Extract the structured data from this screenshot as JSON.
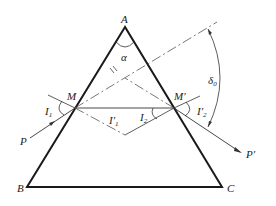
{
  "diagram": {
    "vertices": {
      "A": {
        "label": "A",
        "x": 125,
        "y": 27
      },
      "B": {
        "label": "B",
        "x": 27,
        "y": 187
      },
      "C": {
        "label": "C",
        "x": 222,
        "y": 187
      }
    },
    "points": {
      "M": {
        "label": "M",
        "x": 75,
        "y": 108
      },
      "M_prime": {
        "label": "M′",
        "x": 174,
        "y": 108
      }
    },
    "angles": {
      "apex": {
        "label": "α"
      },
      "incident": {
        "label": "I",
        "sub": "1"
      },
      "refracted1": {
        "label": "I′",
        "sub": "1"
      },
      "incident2": {
        "label": "I",
        "sub": "2"
      },
      "emergent": {
        "label": "I′",
        "sub": "2"
      },
      "deviation": {
        "label": "δ",
        "sub": "0"
      }
    },
    "rays": {
      "in": {
        "label": "P"
      },
      "out": {
        "label": "P′"
      }
    },
    "parallel_mark": "//",
    "colors": {
      "prism": "#1a1a1a",
      "ray": "#333333",
      "dash": "#555555"
    }
  }
}
